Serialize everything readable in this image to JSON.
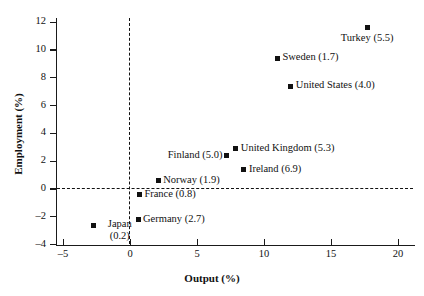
{
  "chart_data": {
    "type": "scatter",
    "title": "",
    "xlabel": "Output (%)",
    "ylabel": "Employment (%)",
    "xlim": [
      -6.5,
      21.2
    ],
    "ylim": [
      -4,
      12.6
    ],
    "xticks": [
      "-5",
      "0",
      "5",
      "10",
      "15",
      "20"
    ],
    "xtick_values": [
      -5,
      0,
      5,
      10,
      15,
      20
    ],
    "yticks": [
      "-4",
      "-2",
      "0",
      "2",
      "4",
      "6",
      "8",
      "10",
      "12"
    ],
    "ytick_values": [
      -4,
      -2,
      0,
      2,
      4,
      6,
      8,
      10,
      12
    ],
    "grid": false,
    "legend": "none",
    "reference_lines": [
      {
        "name": "y-zero",
        "orientation": "horizontal",
        "value": 0,
        "style": "dashed"
      },
      {
        "name": "x-zero",
        "orientation": "vertical",
        "value": 0,
        "style": "dashed"
      }
    ],
    "points": [
      {
        "name": "turkey",
        "label": "Turkey (5.5)",
        "x": 17.7,
        "y": 11.6,
        "extra": 5.5,
        "label_pos": "below"
      },
      {
        "name": "sweden",
        "label": "Sweden (1.7)",
        "x": 11.0,
        "y": 9.4,
        "extra": 1.7,
        "label_pos": "right"
      },
      {
        "name": "united-states",
        "label": "United States (4.0)",
        "x": 12.0,
        "y": 7.4,
        "extra": 4.0,
        "label_pos": "right"
      },
      {
        "name": "united-kingdom",
        "label": "United Kingdom (5.3)",
        "x": 7.9,
        "y": 2.9,
        "extra": 5.3,
        "label_pos": "right"
      },
      {
        "name": "finland",
        "label": "Finland (5.0)",
        "x": 7.2,
        "y": 2.4,
        "extra": 5.0,
        "label_pos": "left"
      },
      {
        "name": "ireland",
        "label": "Ireland (6.9)",
        "x": 8.5,
        "y": 1.4,
        "extra": 6.9,
        "label_pos": "right"
      },
      {
        "name": "norway",
        "label": "Norway (1.9)",
        "x": 2.1,
        "y": 0.6,
        "extra": 1.9,
        "label_pos": "right"
      },
      {
        "name": "france",
        "label": "France (0.8)",
        "x": 0.7,
        "y": -0.4,
        "extra": 0.8,
        "label_pos": "right"
      },
      {
        "name": "germany",
        "label": "Germany (2.7)",
        "x": 0.6,
        "y": -2.2,
        "extra": 2.7,
        "label_pos": "right"
      },
      {
        "name": "japan",
        "label": "Japan",
        "label2": "(0.2)",
        "x": -2.7,
        "y": -2.6,
        "extra": 0.2,
        "label_pos": "right-two-line"
      }
    ]
  }
}
